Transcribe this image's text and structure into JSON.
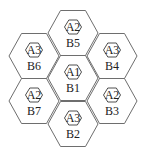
{
  "diagram": {
    "type": "hexagonal-cell-layout",
    "colors": {
      "stroke": "#6e6e6e",
      "text": "#222222",
      "background": "#ffffff"
    },
    "cells": [
      {
        "id": "B5",
        "inner_label": "A2",
        "cell_label": "B5",
        "cx": 73,
        "cy": 33
      },
      {
        "id": "B6",
        "inner_label": "A3",
        "cell_label": "B6",
        "cx": 34,
        "cy": 56
      },
      {
        "id": "B4",
        "inner_label": "A3",
        "cell_label": "B4",
        "cx": 112,
        "cy": 56
      },
      {
        "id": "B1",
        "inner_label": "A1",
        "cell_label": "B1",
        "cx": 73,
        "cy": 78
      },
      {
        "id": "B7",
        "inner_label": "A2",
        "cell_label": "B7",
        "cx": 34,
        "cy": 101
      },
      {
        "id": "B3",
        "inner_label": "A2",
        "cell_label": "B3",
        "cx": 112,
        "cy": 101
      },
      {
        "id": "B2",
        "inner_label": "A3",
        "cell_label": "B2",
        "cx": 73,
        "cy": 124
      }
    ]
  }
}
